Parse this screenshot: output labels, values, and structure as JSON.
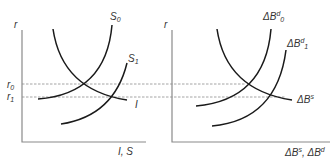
{
  "left_panel": {
    "y_axis_label": "r",
    "x_axis_label": "I, S",
    "rate_ticks": [
      {
        "base": "r",
        "sub": "0"
      },
      {
        "base": "r",
        "sub": "1"
      }
    ],
    "curves": [
      {
        "id": "I",
        "base": "I",
        "sub": "",
        "sup": "",
        "kind": "downward-sloping demand"
      },
      {
        "id": "S0",
        "base": "S",
        "sub": "0",
        "sup": "",
        "kind": "upward-sloping supply (initial)"
      },
      {
        "id": "S1",
        "base": "S",
        "sub": "1",
        "sup": "",
        "kind": "upward-sloping supply (shifted right)"
      }
    ]
  },
  "right_panel": {
    "y_axis_label": "r",
    "x_axis_label": {
      "part1_base": "ΔB",
      "part1_sup": "s",
      "sep": ", ",
      "part2_base": "ΔB",
      "part2_sup": "d"
    },
    "curves": [
      {
        "id": "dBs",
        "base": "ΔB",
        "sup": "s",
        "sub": "",
        "kind": "downward-sloping bond supply"
      },
      {
        "id": "dBd0",
        "base": "ΔB",
        "sup": "d",
        "sub": "0",
        "kind": "upward-sloping bond demand (initial)"
      },
      {
        "id": "dBd1",
        "base": "ΔB",
        "sup": "d",
        "sub": "1",
        "kind": "upward-sloping bond demand (shifted right)"
      }
    ]
  },
  "equilibria": [
    {
      "rate": "r0",
      "left": "I = S0",
      "right": "ΔBs = ΔBd0"
    },
    {
      "rate": "r1",
      "left": "I = S1",
      "right": "ΔBs = ΔBd1"
    }
  ]
}
